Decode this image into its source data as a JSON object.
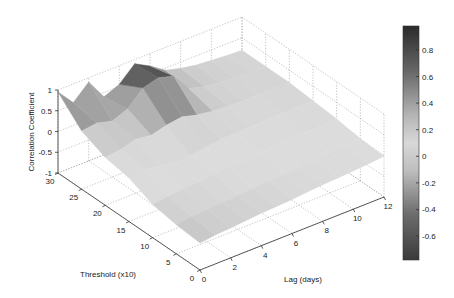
{
  "chart_data": {
    "type": "surface3d",
    "title": "",
    "xlabel": "Lag (days)",
    "ylabel": "Threshold (x10)",
    "zlabel": "Correlation Coefficient",
    "xlim": [
      0,
      12
    ],
    "ylim": [
      0,
      30
    ],
    "zlim": [
      -1,
      1
    ],
    "x_ticks": [
      "0",
      "2",
      "4",
      "6",
      "8",
      "10",
      "12"
    ],
    "y_ticks": [
      "0",
      "5",
      "10",
      "15",
      "20",
      "25",
      "30"
    ],
    "z_ticks": [
      "-1",
      "-0.5",
      "0",
      "0.5",
      "1"
    ],
    "grid": true,
    "colormap": "gray (dark = high, light = mid, dark = low)",
    "colorbar": {
      "position": "right",
      "ticks": [
        "0.8",
        "0.6",
        "0.4",
        "0.2",
        "0",
        "-0.2",
        "-0.4",
        "-0.6"
      ],
      "range": [
        -0.78,
        0.98
      ]
    },
    "x": [
      0,
      1,
      2,
      3,
      4,
      5,
      6,
      7,
      8,
      9,
      10,
      11,
      12
    ],
    "y": [
      0,
      5,
      10,
      15,
      20,
      25,
      30
    ],
    "z": [
      [
        -0.35,
        -0.3,
        -0.28,
        -0.25,
        -0.22,
        -0.2,
        -0.18,
        -0.15,
        -0.12,
        -0.1,
        -0.08,
        -0.05,
        -0.02
      ],
      [
        -0.3,
        -0.25,
        -0.22,
        -0.2,
        -0.18,
        -0.15,
        -0.12,
        -0.1,
        -0.08,
        -0.05,
        -0.03,
        0.0,
        0.02
      ],
      [
        -0.2,
        -0.15,
        -0.12,
        -0.1,
        -0.05,
        -0.02,
        0.0,
        0.02,
        0.04,
        0.05,
        0.06,
        0.08,
        0.1
      ],
      [
        0.05,
        0.1,
        0.05,
        -0.05,
        0.0,
        0.05,
        0.1,
        0.1,
        0.12,
        0.12,
        0.14,
        0.15,
        0.15
      ],
      [
        0.15,
        0.2,
        0.3,
        0.25,
        0.35,
        0.4,
        0.3,
        0.25,
        0.22,
        0.2,
        0.2,
        0.2,
        0.2
      ],
      [
        0.4,
        0.45,
        0.35,
        0.5,
        0.85,
        0.95,
        0.85,
        0.4,
        0.3,
        0.25,
        0.22,
        0.2,
        0.2
      ],
      [
        0.95,
        0.55,
        0.9,
        0.4,
        0.55,
        0.9,
        0.7,
        0.45,
        0.35,
        0.28,
        0.25,
        0.22,
        0.2
      ]
    ]
  }
}
